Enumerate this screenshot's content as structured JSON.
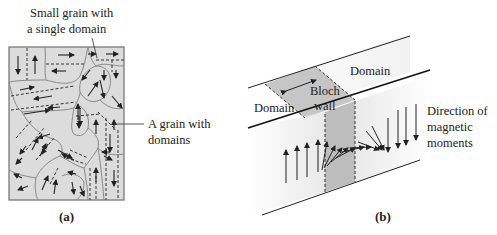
{
  "figure": {
    "panel_a": {
      "caption": "(a)",
      "callout_top_line1": "Small grain with",
      "callout_top_line2": "a single domain",
      "callout_right_line1": "A grain with",
      "callout_right_line2": "domains"
    },
    "panel_b": {
      "caption": "(b)",
      "domain_left": "Domain",
      "domain_right": "Domain",
      "wall_line1": "Bloch",
      "wall_line2": "wall",
      "moments_line1": "Direction of",
      "moments_line2": "magnetic",
      "moments_line3": "moments"
    },
    "colors": {
      "grain_fill": "#d9d9d9",
      "wall_fill": "#bdbdbd",
      "ink": "#222222",
      "grain_border": "#8a8a8a"
    }
  }
}
